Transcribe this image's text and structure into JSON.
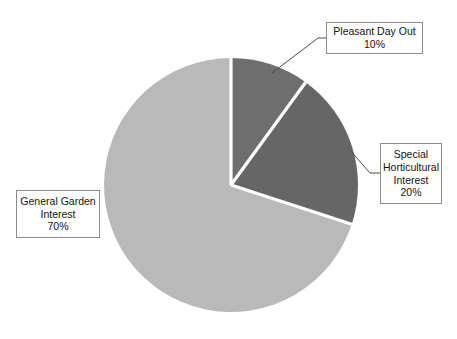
{
  "chart_data": {
    "type": "pie",
    "title": "",
    "categories": [
      "Pleasant Day Out",
      "Special Horticultural Interest",
      "General Garden Interest"
    ],
    "values": [
      10,
      20,
      70
    ],
    "value_labels": [
      "10%",
      "20%",
      "70%"
    ],
    "unit": "%",
    "total": 100,
    "start_angle_deg": 0,
    "direction": "clockwise",
    "legend": "none",
    "grid": false,
    "labels_position": "callout-boxes-with-leader-lines",
    "slices": [
      {
        "name": "Pleasant Day Out",
        "value": 10,
        "value_label": "10%",
        "color": "#6e6e6e",
        "start_deg": 0,
        "end_deg": 36
      },
      {
        "name": "Special Horticultural Interest",
        "value": 20,
        "value_label": "20%",
        "color": "#666666",
        "start_deg": 36,
        "end_deg": 108
      },
      {
        "name": "General Garden Interest",
        "value": 70,
        "value_label": "70%",
        "color": "#b9b9b9",
        "start_deg": 108,
        "end_deg": 360
      }
    ]
  },
  "callouts": {
    "pleasant": {
      "line1": "Pleasant Day Out",
      "line2": "10%"
    },
    "special": {
      "line1": "Special",
      "line2": "Horticultural",
      "line3": "Interest",
      "line4": "20%"
    },
    "general": {
      "line1": "General Garden",
      "line2": "Interest",
      "line3": "70%"
    }
  },
  "style": {
    "background": "#ffffff",
    "separator_color": "#ffffff",
    "border_color": "#8c8c8c",
    "leader_color": "#4d4d4d"
  }
}
